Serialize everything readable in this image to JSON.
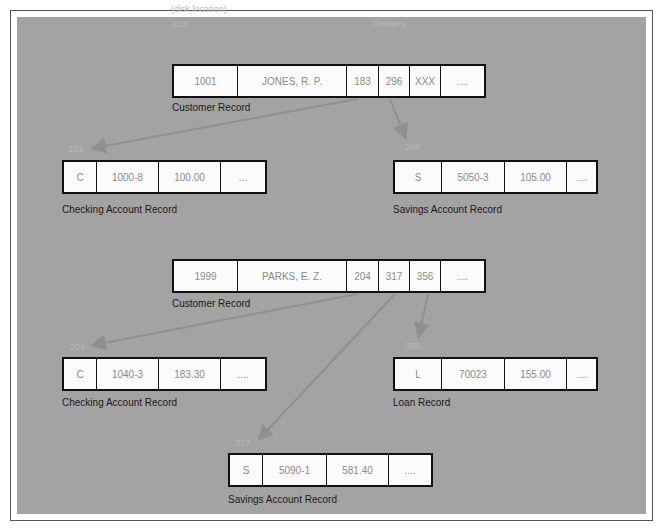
{
  "annotations": {
    "disk_location": "(disk location)",
    "pointers": "Pointers"
  },
  "records": [
    {
      "id": "cust1",
      "label": "Customer Record",
      "address": "124",
      "cells": [
        "1001",
        "JONES, R. P.",
        "183",
        "296",
        "XXX",
        "...."
      ]
    },
    {
      "id": "chk1",
      "label": "Checking Account Record",
      "address": "183",
      "cells": [
        "C",
        "1000-8",
        "100.00",
        "..."
      ]
    },
    {
      "id": "sav1",
      "label": "Savings Account Record",
      "address": "296",
      "cells": [
        "S",
        "5050-3",
        "105.00",
        "...."
      ]
    },
    {
      "id": "cust2",
      "label": "Customer Record",
      "address": "",
      "cells": [
        "1999",
        "PARKS, E. Z.",
        "204",
        "317",
        "356",
        "...."
      ]
    },
    {
      "id": "chk2",
      "label": "Checking Account Record",
      "address": "204",
      "cells": [
        "C",
        "1040-3",
        "183.30",
        "...."
      ]
    },
    {
      "id": "loan1",
      "label": "Loan Record",
      "address": "356",
      "cells": [
        "L",
        "70023",
        "155.00",
        "...."
      ]
    },
    {
      "id": "sav2",
      "label": "Savings Account Record",
      "address": "317",
      "cells": [
        "S",
        "5090-1",
        "581.40",
        "...."
      ]
    }
  ],
  "colors": {
    "panel": "#a3a3a3",
    "arrow": "#8f8f8f",
    "cell_bg": "#fbfbfb",
    "border": "#111111"
  }
}
